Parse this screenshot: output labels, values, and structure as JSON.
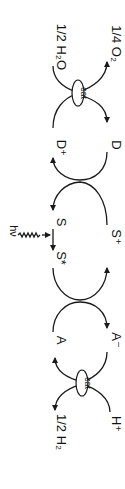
{
  "diagram": {
    "orientation": "rotated 90 degrees clockwise",
    "labels": {
      "h2o": "1/2 H₂O",
      "o2": "1/4 O₂",
      "cat_top": "cat",
      "d_plus": "D⁺",
      "d": "D",
      "s": "S",
      "s_star": "S*",
      "s_plus": "S⁺",
      "hv": "hν",
      "a": "A",
      "a_minus": "A⁻",
      "cat_bottom": "cat",
      "h2": "1/2 H₂",
      "h_plus": "H⁺"
    },
    "nodes": [
      {
        "id": "H2O",
        "label": "1/2 H2O"
      },
      {
        "id": "O2",
        "label": "1/4 O2"
      },
      {
        "id": "cat1",
        "label": "cat"
      },
      {
        "id": "Dplus",
        "label": "D+"
      },
      {
        "id": "D",
        "label": "D"
      },
      {
        "id": "S",
        "label": "S"
      },
      {
        "id": "Sstar",
        "label": "S*"
      },
      {
        "id": "Splus",
        "label": "S+"
      },
      {
        "id": "A",
        "label": "A"
      },
      {
        "id": "Aminus",
        "label": "A-"
      },
      {
        "id": "cat2",
        "label": "cat"
      },
      {
        "id": "H2",
        "label": "1/2 H2"
      },
      {
        "id": "Hplus",
        "label": "H+"
      }
    ],
    "edges": [
      {
        "from": "H2O",
        "to": "O2",
        "via": "cat1"
      },
      {
        "from": "Dplus",
        "to": "D",
        "via": "cat1"
      },
      {
        "from": "D",
        "to": "Dplus",
        "via": "Splus->S"
      },
      {
        "from": "S",
        "to": "Sstar",
        "label": "hv"
      },
      {
        "from": "Sstar",
        "to": "Splus",
        "via": "A->A-"
      },
      {
        "from": "A",
        "to": "Aminus"
      },
      {
        "from": "Aminus",
        "to": "A",
        "via": "cat2"
      },
      {
        "from": "Hplus",
        "to": "H2",
        "via": "cat2"
      }
    ]
  }
}
